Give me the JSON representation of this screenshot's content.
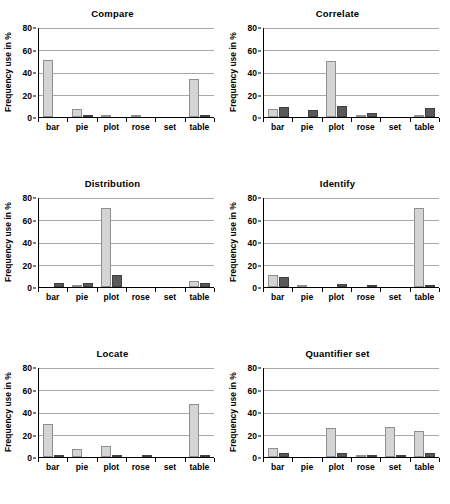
{
  "figure": {
    "ylabel": "Frequency use in %",
    "categories": [
      "bar",
      "pie",
      "plot",
      "rose",
      "set",
      "table"
    ],
    "yticks": [
      "0",
      "20",
      "40",
      "60",
      "80"
    ],
    "colors": {
      "series_light": "#d4d4d4",
      "series_dark": "#595959",
      "gridline": "#a9a9a9",
      "axis": "#000000"
    }
  },
  "chart_data": [
    {
      "type": "bar",
      "title": "Compare",
      "categories": [
        "bar",
        "pie",
        "plot",
        "rose",
        "set",
        "table"
      ],
      "series": [
        {
          "name": "series-light",
          "values": [
            51,
            7,
            2,
            2,
            0,
            34.5
          ]
        },
        {
          "name": "series-dark",
          "values": [
            0,
            1,
            0,
            0,
            0,
            1
          ]
        }
      ],
      "xlabel": "",
      "ylabel": "Frequency use in %",
      "ylim": [
        0,
        80
      ],
      "grid": true,
      "legend": "none"
    },
    {
      "type": "bar",
      "title": "Correlate",
      "categories": [
        "bar",
        "pie",
        "plot",
        "rose",
        "set",
        "table"
      ],
      "series": [
        {
          "name": "series-light",
          "values": [
            7,
            0,
            50,
            2,
            0,
            1
          ]
        },
        {
          "name": "series-dark",
          "values": [
            9,
            6,
            10,
            4,
            0,
            8
          ]
        }
      ],
      "xlabel": "",
      "ylabel": "Frequency use in %",
      "ylim": [
        0,
        80
      ],
      "grid": true,
      "legend": "none"
    },
    {
      "type": "bar",
      "title": "Distribution",
      "categories": [
        "bar",
        "pie",
        "plot",
        "rose",
        "set",
        "table"
      ],
      "series": [
        {
          "name": "series-light",
          "values": [
            0,
            1,
            71,
            0,
            0,
            5
          ]
        },
        {
          "name": "series-dark",
          "values": [
            3.5,
            3.5,
            10.5,
            0,
            0,
            4
          ]
        }
      ],
      "xlabel": "",
      "ylabel": "Frequency use in %",
      "ylim": [
        0,
        80
      ],
      "grid": true,
      "legend": "none"
    },
    {
      "type": "bar",
      "title": "Identify",
      "categories": [
        "bar",
        "pie",
        "plot",
        "rose",
        "set",
        "table"
      ],
      "series": [
        {
          "name": "series-light",
          "values": [
            11,
            2,
            0,
            0,
            0,
            71
          ]
        },
        {
          "name": "series-dark",
          "values": [
            9,
            0,
            2.5,
            1.5,
            0,
            1
          ]
        }
      ],
      "xlabel": "",
      "ylabel": "Frequency use in %",
      "ylim": [
        0,
        80
      ],
      "grid": true,
      "legend": "none"
    },
    {
      "type": "bar",
      "title": "Locate",
      "categories": [
        "bar",
        "pie",
        "plot",
        "rose",
        "set",
        "table"
      ],
      "series": [
        {
          "name": "series-light",
          "values": [
            29.5,
            7,
            10,
            0,
            0,
            48
          ]
        },
        {
          "name": "series-dark",
          "values": [
            1,
            0,
            1,
            2,
            0,
            1
          ]
        }
      ],
      "xlabel": "",
      "ylabel": "Frequency use in %",
      "ylim": [
        0,
        80
      ],
      "grid": true,
      "legend": "none"
    },
    {
      "type": "bar",
      "title": "Quantifier set",
      "categories": [
        "bar",
        "pie",
        "plot",
        "rose",
        "set",
        "table"
      ],
      "series": [
        {
          "name": "series-light",
          "values": [
            8,
            0,
            26,
            1,
            27,
            23
          ]
        },
        {
          "name": "series-dark",
          "values": [
            3.5,
            0,
            4,
            1,
            2,
            4
          ]
        }
      ],
      "xlabel": "",
      "ylabel": "Frequency use in %",
      "ylim": [
        0,
        80
      ],
      "grid": true,
      "legend": "none"
    }
  ]
}
